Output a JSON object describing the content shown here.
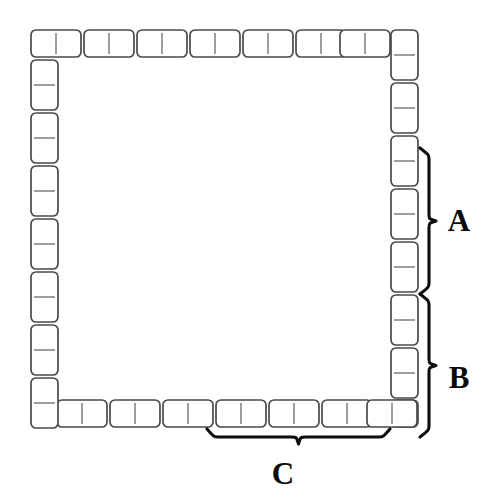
{
  "figure": {
    "background_color": "#ffffff",
    "tile_fill": "#ffffff",
    "tile_stroke": "#4a4a4a",
    "divider_stroke": "#6a6a6a",
    "brace_color": "#0d0d0d",
    "label_color": "#0b0b0b",
    "canvas": {
      "width": 494,
      "height": 504
    },
    "geometry": {
      "tile_unit_px": 25,
      "domino_long_px": 50,
      "domino_short_px": 27,
      "corner_radius_px": 5,
      "ring_left_x": 31,
      "ring_top_y": 30,
      "ring_right_x": 418,
      "ring_bottom_y": 427
    },
    "counts": {
      "top_row_dominoes": 7,
      "right_column_dominoes": 8,
      "bottom_row_dominoes": 7,
      "left_column_dominoes": 8,
      "total_dominoes": 30,
      "total_squares": 60
    },
    "labels": [
      {
        "id": "A",
        "text": "A",
        "side": "right",
        "label_x": 459,
        "label_y": 231,
        "brace_span_start": 148,
        "brace_span_end": 294,
        "dominoes_spanned": 3
      },
      {
        "id": "B",
        "text": "B",
        "side": "right",
        "label_x": 459,
        "label_y": 388,
        "brace_span_start": 294,
        "brace_span_end": 437,
        "dominoes_spanned": 3
      },
      {
        "id": "C",
        "text": "C",
        "side": "bottom",
        "label_x": 283,
        "label_y": 484,
        "brace_span_start": 207,
        "brace_span_end": 390,
        "dominoes_spanned": 3
      }
    ],
    "tiles": {
      "top_row": [
        {
          "x": 31,
          "y": 30,
          "w": 50,
          "h": 27,
          "orientation": "horizontal"
        },
        {
          "x": 84,
          "y": 30,
          "w": 50,
          "h": 27,
          "orientation": "horizontal"
        },
        {
          "x": 137,
          "y": 30,
          "w": 50,
          "h": 27,
          "orientation": "horizontal"
        },
        {
          "x": 190,
          "y": 30,
          "w": 50,
          "h": 27,
          "orientation": "horizontal"
        },
        {
          "x": 243,
          "y": 30,
          "w": 50,
          "h": 27,
          "orientation": "horizontal"
        },
        {
          "x": 296,
          "y": 30,
          "w": 50,
          "h": 27,
          "orientation": "horizontal"
        },
        {
          "x": 340,
          "y": 30,
          "w": 50,
          "h": 27,
          "orientation": "horizontal"
        }
      ],
      "right_column": [
        {
          "x": 391,
          "y": 30,
          "w": 27,
          "h": 50,
          "orientation": "vertical"
        },
        {
          "x": 391,
          "y": 83,
          "w": 27,
          "h": 50,
          "orientation": "vertical"
        },
        {
          "x": 391,
          "y": 136,
          "w": 27,
          "h": 50,
          "orientation": "vertical"
        },
        {
          "x": 391,
          "y": 189,
          "w": 27,
          "h": 50,
          "orientation": "vertical"
        },
        {
          "x": 391,
          "y": 242,
          "w": 27,
          "h": 50,
          "orientation": "vertical"
        },
        {
          "x": 391,
          "y": 295,
          "w": 27,
          "h": 50,
          "orientation": "vertical"
        },
        {
          "x": 391,
          "y": 348,
          "w": 27,
          "h": 50,
          "orientation": "vertical"
        },
        {
          "x": 391,
          "y": 400,
          "w": 27,
          "h": 27,
          "orientation": "vertical"
        }
      ],
      "bottom_row": [
        {
          "x": 57,
          "y": 400,
          "w": 50,
          "h": 27,
          "orientation": "horizontal"
        },
        {
          "x": 110,
          "y": 400,
          "w": 50,
          "h": 27,
          "orientation": "horizontal"
        },
        {
          "x": 163,
          "y": 400,
          "w": 50,
          "h": 27,
          "orientation": "horizontal"
        },
        {
          "x": 216,
          "y": 400,
          "w": 50,
          "h": 27,
          "orientation": "horizontal"
        },
        {
          "x": 269,
          "y": 400,
          "w": 50,
          "h": 27,
          "orientation": "horizontal"
        },
        {
          "x": 322,
          "y": 400,
          "w": 50,
          "h": 27,
          "orientation": "horizontal"
        },
        {
          "x": 367,
          "y": 400,
          "w": 50,
          "h": 27,
          "orientation": "horizontal"
        }
      ],
      "left_column": [
        {
          "x": 31,
          "y": 60,
          "w": 27,
          "h": 50,
          "orientation": "vertical"
        },
        {
          "x": 31,
          "y": 113,
          "w": 27,
          "h": 50,
          "orientation": "vertical"
        },
        {
          "x": 31,
          "y": 166,
          "w": 27,
          "h": 50,
          "orientation": "vertical"
        },
        {
          "x": 31,
          "y": 219,
          "w": 27,
          "h": 50,
          "orientation": "vertical"
        },
        {
          "x": 31,
          "y": 272,
          "w": 27,
          "h": 50,
          "orientation": "vertical"
        },
        {
          "x": 31,
          "y": 325,
          "w": 27,
          "h": 50,
          "orientation": "vertical"
        },
        {
          "x": 31,
          "y": 378,
          "w": 27,
          "h": 50,
          "orientation": "vertical"
        }
      ]
    }
  }
}
